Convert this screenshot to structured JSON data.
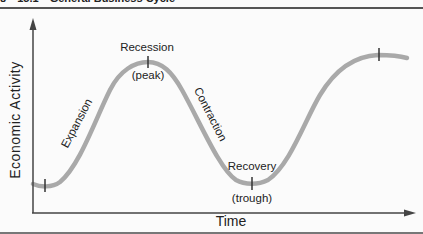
{
  "figure": {
    "header": {
      "number": "8",
      "figure_id": "15.1",
      "title": "General Business Cycle"
    },
    "axes": {
      "ylabel": "Economic Activity",
      "xlabel": "Time"
    },
    "phases": [
      {
        "label": "Expansion"
      },
      {
        "label": "Recession",
        "sublabel": "(peak)"
      },
      {
        "label": "Contraction"
      },
      {
        "label": "Recovery",
        "sublabel": "(trough)"
      }
    ],
    "colors": {
      "curve": "#a9a9a9",
      "axis": "#444444",
      "tick": "#333333"
    }
  }
}
